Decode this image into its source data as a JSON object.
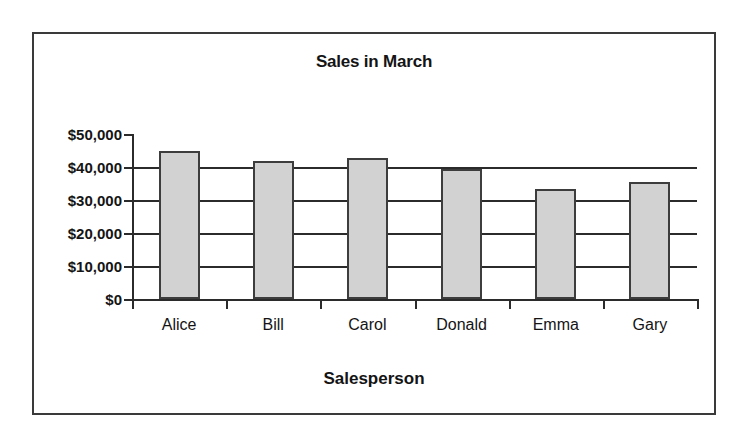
{
  "chart_data": {
    "type": "bar",
    "title": "Sales in March",
    "xlabel": "Salesperson",
    "ylabel": "",
    "categories": [
      "Alice",
      "Bill",
      "Carol",
      "Donald",
      "Emma",
      "Gary"
    ],
    "values": [
      45000,
      41700,
      42700,
      39400,
      33400,
      35500
    ],
    "ylim": [
      0,
      50000
    ],
    "ytick_values": [
      0,
      10000,
      20000,
      30000,
      40000,
      50000
    ],
    "ytick_labels": [
      "$0",
      "$10,000",
      "$20,000",
      "$30,000",
      "$40,000",
      "$50,000"
    ],
    "grid": true,
    "legend": false,
    "bar_fill_color": "#d2d2d2",
    "bar_edge_color": "#3d3d3d",
    "axis_color": "#2b2b2b",
    "text_color": "#141414",
    "frame_color": "#3a3a3a",
    "background_color": "#ffffff"
  }
}
